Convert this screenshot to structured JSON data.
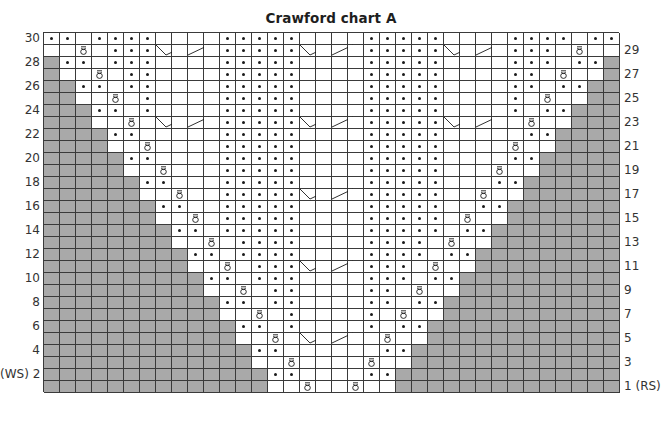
{
  "title": "Crawford chart A",
  "colors": {
    "grid_line": "#3a3a3a",
    "shaded": "#a9a9a9",
    "background": "#ffffff",
    "symbol": "#1a1a1a"
  },
  "legend_codes": {
    ".": "knit (blank cell)",
    "p": "purl (dot)",
    "t": "twisted stitch (loop symbol)",
    "x": "no stitch (grey)",
    "L": "cable cross left half part 1",
    "l": "cable cross left half part 2",
    "R": "cable cross right half part 1",
    "r": "cable cross right half part 2"
  },
  "chart_data": {
    "type": "table",
    "title": "Crawford chart A",
    "columns": 36,
    "rows": 30,
    "row_labels_left": [
      "30",
      "28",
      "26",
      "24",
      "22",
      "20",
      "18",
      "16",
      "14",
      "12",
      "10",
      "8",
      "6",
      "4",
      "(WS) 2"
    ],
    "row_labels_right": [
      "29",
      "27",
      "25",
      "23",
      "21",
      "19",
      "17",
      "15",
      "13",
      "11",
      "9",
      "7",
      "5",
      "3",
      "1 (RS)"
    ],
    "grid_top_to_bottom": [
      "pp.pppp....ppppp....ppppp....pppp.pp",
      "..t.pppLlRrpppppLlRrpppppLlRrppp.t..",
      "xpp.ppp....ppppp....ppppp....ppp.ppx",
      "x..t.pp....ppppp....ppppp....pp.t..x",
      "xxpp.pp....ppppp....ppppp....pp.ppxx",
      "xx..t.p....ppppp....ppppp....p.t..xx",
      "xxxpp.p....ppppp....ppppp....p.ppxxx",
      "xxx..t.LlRrpppppLlRrpppppLlRr.t..xxx",
      "xxxxpp.....ppppp....ppppp.....ppxxxx",
      "xxxx..t....ppppp....ppppp....t..xxxx",
      "xxxxxpp....ppppp....ppppp....ppxxxxx",
      "xxxxx..t...ppppp....ppppp...t..xxxxx",
      "xxxxxxpp...ppppp....ppppp...ppxxxxxx",
      "xxxxxx..t..pppppLlRrppppp..t..xxxxxx",
      "xxxxxxxpp..ppppp....ppppp..ppxxxxxxx",
      "xxxxxxx..t.ppppp....ppppp.t..xxxxxxx",
      "xxxxxxxxpp.ppppp....ppppp.ppxxxxxxxx",
      "xxxxxxxx..t.pppp....pppp.t..xxxxxxxx",
      "xxxxxxxxxpp.pppp....pppp.ppxxxxxxxxx",
      "xxxxxxxxx..t.pppLlRrppp.t..xxxxxxxxx",
      "xxxxxxxxxxpp.ppp....ppp.ppxxxxxxxxxx",
      "xxxxxxxxxx..t.pp....pp.t..xxxxxxxxxx",
      "xxxxxxxxxxxpp.pp....pp.ppxxxxxxxxxxx",
      "xxxxxxxxxxx..t.p....p.t..xxxxxxxxxxx",
      "xxxxxxxxxxxxpp.p....p.ppxxxxxxxxxxxx",
      "xxxxxxxxxxxx..t.LlRr.t..xxxxxxxxxxxx",
      "xxxxxxxxxxxxxpp......ppxxxxxxxxxxxxx",
      "xxxxxxxxxxxxx..t....t..xxxxxxxxxxxxx",
      "xxxxxxxxxxxxxxpp....ppxxxxxxxxxxxxxx",
      "xxxxxxxxxxxxxx..t..t..xxxxxxxxxxxxxx"
    ]
  }
}
